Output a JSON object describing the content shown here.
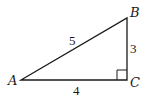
{
  "diagram": {
    "type": "right-triangle",
    "vertices": {
      "A": {
        "label": "A",
        "x": 21,
        "y": 80
      },
      "B": {
        "label": "B",
        "x": 127,
        "y": 18
      },
      "C": {
        "label": "C",
        "x": 127,
        "y": 80
      }
    },
    "sides": {
      "AB": {
        "label": "5"
      },
      "BC": {
        "label": "3"
      },
      "AC": {
        "label": "4"
      }
    },
    "right_angle_at": "C",
    "stroke_color": "#1a1a1a",
    "background": "#ffffff"
  }
}
